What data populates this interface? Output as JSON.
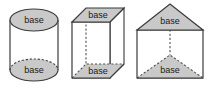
{
  "image": {
    "title": "Solid figures with bases labeled",
    "background_color": "#ffffff",
    "width": 208,
    "height": 90
  },
  "style": {
    "base_fill": "#c9c9c9",
    "side_fill": "#ffffff",
    "outline_color": "#3b3b3b",
    "hidden_edge_color": "#555555",
    "label_color": "#1a1a1a"
  },
  "figures": [
    {
      "id": "cylinder",
      "name": "cylinder",
      "top_base_label": "base",
      "bottom_base_label": "base"
    },
    {
      "id": "cube",
      "name": "rectangular-prism",
      "top_base_label": "base",
      "bottom_base_label": "base"
    },
    {
      "id": "prism",
      "name": "triangular-prism",
      "top_base_label": "base",
      "bottom_base_label": "base"
    }
  ]
}
